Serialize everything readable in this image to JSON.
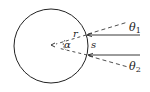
{
  "diagram": {
    "type": "geometry",
    "labels": {
      "r": "r",
      "alpha": "α",
      "s": "s",
      "theta1_main": "θ",
      "theta1_sub": "1",
      "theta2_main": "θ",
      "theta2_sub": "2"
    },
    "colors": {
      "stroke": "#222222",
      "background": "#ffffff"
    },
    "elements": [
      "circle",
      "upper-solid-ray",
      "lower-solid-ray",
      "upper-dashed-line-theta1",
      "lower-dashed-line-theta2",
      "radius-dashed-lines",
      "alpha-arc",
      "center-arrow"
    ]
  }
}
